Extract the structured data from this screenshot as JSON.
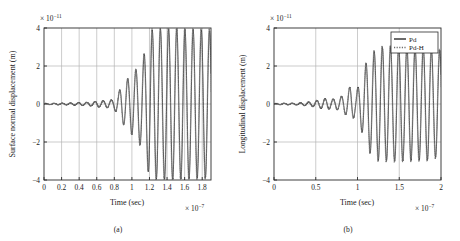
{
  "figure": {
    "panels": [
      {
        "id": "a",
        "subcaption": "(a)",
        "xlabel": "Time (sec)",
        "ylabel": "Surface normal displacement (m)",
        "x_exponent_prefix": "× 10",
        "x_exponent_power": "−7",
        "y_exponent_prefix": "× 10",
        "y_exponent_power": "−11",
        "xticks": [
          "0",
          "0.2",
          "0.4",
          "0.6",
          "0.8",
          "1",
          "1.2",
          "1.4",
          "1.6",
          "1.8"
        ],
        "yticks": [
          "4",
          "2",
          "0",
          "−2",
          "−4"
        ],
        "legend": null
      },
      {
        "id": "b",
        "subcaption": "(b)",
        "xlabel": "Time (sec)",
        "ylabel": "Longitudinal displacement (m)",
        "x_exponent_prefix": "× 10",
        "x_exponent_power": "−7",
        "y_exponent_prefix": "× 10",
        "y_exponent_power": "−11",
        "xticks": [
          "0",
          "0.5",
          "1",
          "1.5",
          "2"
        ],
        "yticks": [
          "4",
          "2",
          "0",
          "−2",
          "−4"
        ],
        "legend": {
          "entries": [
            {
              "label": "Pd",
              "style": "solid"
            },
            {
              "label": "Pd-H",
              "style": "dotted"
            }
          ]
        }
      }
    ]
  },
  "colors": {
    "axis": "#2b2b2b",
    "grid": "#b6b6b6",
    "series_pd": "#1c1c1c",
    "series_pdh": "#6e6e6e",
    "background": "#ffffff"
  },
  "chart_data": [
    {
      "type": "line",
      "panel": "a",
      "title": "",
      "xlabel": "Time (sec)",
      "ylabel": "Surface normal displacement (m)",
      "x_unit_scale": 1e-07,
      "y_unit_scale": 1e-11,
      "xlim": [
        0,
        1.9
      ],
      "ylim": [
        -4,
        4
      ],
      "grid": true,
      "legend_position": "none",
      "xticks": [
        0,
        0.2,
        0.4,
        0.6,
        0.8,
        1,
        1.2,
        1.4,
        1.6,
        1.8
      ],
      "yticks": [
        -4,
        -2,
        0,
        2,
        4
      ],
      "description": "Ultrasonic waveform: flat near zero until t~0.6, small ripples 0.6-0.85, growing oscillations 0.85-1.2, saturated oscillation at +/-4 from 1.2 to 1.9",
      "envelope": {
        "x": [
          0,
          0.3,
          0.55,
          0.62,
          0.7,
          0.78,
          0.84,
          0.88,
          0.92,
          0.96,
          1.0,
          1.04,
          1.08,
          1.12,
          1.16,
          1.2,
          1.3,
          1.5,
          1.7,
          1.9
        ],
        "amplitude": [
          0.03,
          0.05,
          0.1,
          0.16,
          0.18,
          0.22,
          0.5,
          0.95,
          1.15,
          1.35,
          1.6,
          1.75,
          2.05,
          2.3,
          2.95,
          3.85,
          3.95,
          3.95,
          3.9,
          3.85
        ]
      },
      "oscillation_period": 0.093,
      "series": [
        {
          "name": "Pd",
          "style": "solid",
          "color": "#1c1c1c",
          "values_note": "sinusoidal carrier modulated by envelope above"
        },
        {
          "name": "Pd-H",
          "style": "dotted",
          "color": "#6e6e6e",
          "values_note": "nearly coincident with Pd, slight phase lag, marginally larger peaks"
        }
      ]
    },
    {
      "type": "line",
      "panel": "b",
      "title": "",
      "xlabel": "Time (sec)",
      "ylabel": "Longitudinal displacement (m)",
      "x_unit_scale": 1e-07,
      "y_unit_scale": 1e-11,
      "xlim": [
        0,
        2.0
      ],
      "ylim": [
        -4,
        4
      ],
      "grid": true,
      "legend_position": "upper right",
      "xticks": [
        0,
        0.5,
        1,
        1.5,
        2
      ],
      "yticks": [
        -4,
        -2,
        0,
        2,
        4
      ],
      "description": "Ultrasonic waveform: flat near zero until t~0.45, small ripples 0.45-0.9, growing oscillations 0.9-1.15, saturated oscillation at +/-3 from 1.15 to 1.9",
      "envelope": {
        "x": [
          0,
          0.3,
          0.45,
          0.55,
          0.62,
          0.7,
          0.78,
          0.86,
          0.92,
          0.98,
          1.02,
          1.06,
          1.1,
          1.15,
          1.25,
          1.45,
          1.65,
          1.85,
          1.9
        ],
        "amplitude": [
          0.03,
          0.05,
          0.12,
          0.22,
          0.28,
          0.25,
          0.32,
          0.55,
          0.95,
          0.55,
          1.05,
          1.55,
          2.1,
          2.55,
          2.95,
          3.0,
          2.95,
          2.95,
          2.8
        ]
      },
      "oscillation_period": 0.098,
      "series": [
        {
          "name": "Pd",
          "style": "solid",
          "color": "#1c1c1c",
          "values_note": "sinusoidal carrier modulated by envelope above"
        },
        {
          "name": "Pd-H",
          "style": "dotted",
          "color": "#6e6e6e",
          "values_note": "nearly coincident with Pd, slight phase lag"
        }
      ]
    }
  ]
}
